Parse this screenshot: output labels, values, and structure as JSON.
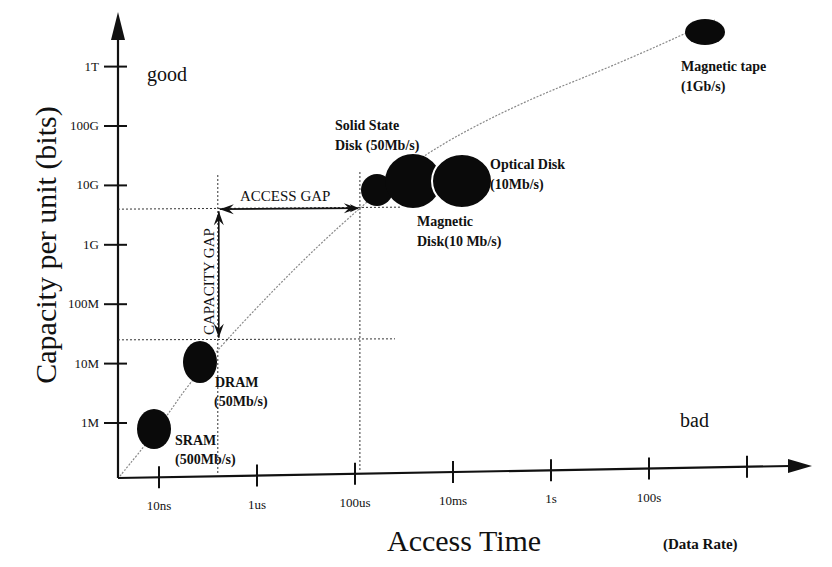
{
  "chart_data": {
    "type": "scatter",
    "title": "",
    "xlabel": "Access Time",
    "xlabel_suffix": "(Data Rate)",
    "ylabel": "Capacity per unit (bits)",
    "x_scale": "log",
    "y_scale": "log",
    "x_ticks": [
      {
        "label": "10ns",
        "log10_seconds": -8
      },
      {
        "label": "1us",
        "log10_seconds": -6
      },
      {
        "label": "100us",
        "log10_seconds": -4
      },
      {
        "label": "10ms",
        "log10_seconds": -2
      },
      {
        "label": "1s",
        "log10_seconds": 0
      },
      {
        "label": "100s",
        "log10_seconds": 2
      },
      {
        "label": "",
        "log10_seconds": 4
      }
    ],
    "y_ticks": [
      {
        "label": "1M",
        "log10_bits": 6
      },
      {
        "label": "10M",
        "log10_bits": 7
      },
      {
        "label": "100M",
        "log10_bits": 8
      },
      {
        "label": "1G",
        "log10_bits": 9
      },
      {
        "label": "10G",
        "log10_bits": 10
      },
      {
        "label": "100G",
        "log10_bits": 11
      },
      {
        "label": "1T",
        "log10_bits": 12
      }
    ],
    "xlim_log10": [
      -8.85,
      5.2
    ],
    "ylim_log10": [
      5.2,
      12.9
    ],
    "points": [
      {
        "name": "SRAM",
        "rate": "(500Mb/s)",
        "log10_time": -8.1,
        "log10_bits": 5.9,
        "size": "small"
      },
      {
        "name": "DRAM",
        "rate": "(50Mb/s)",
        "log10_time": -7.2,
        "log10_bits": 7.03,
        "size": "small"
      },
      {
        "name": "Solid State Disk (50Mb/s)",
        "rate": "",
        "log10_time": -3.55,
        "log10_bits": 9.95,
        "size": "small"
      },
      {
        "name": "Magnetic Disk(10 Mb/s)",
        "rate": "",
        "log10_time": -2.8,
        "log10_bits": 10.1,
        "size": "large"
      },
      {
        "name": "Optical Disk",
        "rate": "(10Mb/s)",
        "log10_time": -1.8,
        "log10_bits": 10.1,
        "size": "large"
      },
      {
        "name": "Magnetic tape",
        "rate": "(1Gb/s)",
        "log10_time": 3.15,
        "log10_bits": 12.6,
        "size": "small"
      }
    ],
    "trend_curve": "dotted curve rising from the origin through SRAM, DRAM, SSD, disks to magnetic tape",
    "annotations": {
      "good": "good",
      "bad": "bad",
      "access_gap": "ACCESS GAP",
      "capacity_gap": "CAPACITY GAP"
    },
    "gaps": {
      "access_gap_from_log10_time": -6.8,
      "access_gap_to_log10_time": -3.9,
      "access_gap_at_log10_bits": 9.6,
      "capacity_gap_from_log10_bits": 7.4,
      "capacity_gap_to_log10_bits": 9.6,
      "capacity_gap_at_log10_time": -6.8
    }
  }
}
